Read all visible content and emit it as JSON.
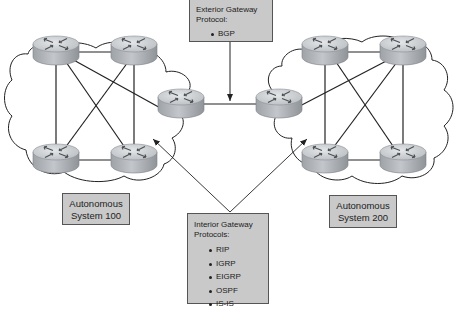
{
  "diagram": {
    "type": "network-topology",
    "exterior_box": {
      "title": "Exterior Gateway Protocol:",
      "title_line1": "Exterior Gateway",
      "title_line2": "Protocol:",
      "items": [
        "BGP"
      ]
    },
    "interior_box": {
      "title_line1": "Interior Gateway",
      "title_line2": "Protocols:",
      "items": [
        "RIP",
        "IGRP",
        "EIGRP",
        "OSPF",
        "IS-IS"
      ]
    },
    "autonomous_systems": [
      {
        "label_line1": "Autonomous",
        "label_line2": "System 100",
        "routers": 5
      },
      {
        "label_line1": "Autonomous",
        "label_line2": "System 200",
        "routers": 5
      }
    ],
    "colors": {
      "box_fill": "#c9c9c9",
      "box_border": "#555555",
      "router_top": "#d4d6d8",
      "router_side": "#a9adb2",
      "line": "#222222"
    }
  }
}
